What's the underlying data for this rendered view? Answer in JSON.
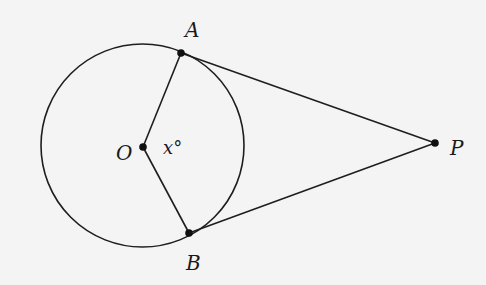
{
  "diagram": {
    "circle": {
      "center_label": "O",
      "cx": 142.5,
      "cy": 145.5,
      "r": 101.5
    },
    "points": {
      "O": {
        "label": "O",
        "x": 143,
        "y": 147
      },
      "A": {
        "label": "A",
        "x": 181,
        "y": 53
      },
      "B": {
        "label": "B",
        "x": 189,
        "y": 233
      },
      "P": {
        "label": "P",
        "x": 435,
        "y": 143
      }
    },
    "angle_label": "x°",
    "segments": [
      [
        "O",
        "A"
      ],
      [
        "O",
        "B"
      ],
      [
        "A",
        "P"
      ],
      [
        "B",
        "P"
      ]
    ],
    "colors": {
      "stroke": "#1e1e1e",
      "background": "#f4f4f4"
    }
  }
}
